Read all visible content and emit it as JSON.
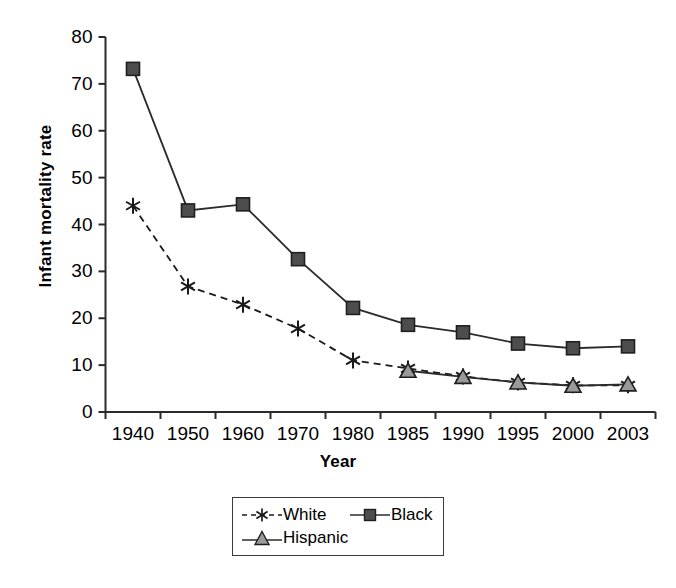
{
  "chart_data": {
    "type": "line",
    "title": "",
    "xlabel": "Year",
    "ylabel": "Infant mortality rate",
    "categories": [
      "1940",
      "1950",
      "1960",
      "1970",
      "1980",
      "1985",
      "1990",
      "1995",
      "2000",
      "2003"
    ],
    "ylim": [
      0,
      80
    ],
    "yticks": [
      0,
      10,
      20,
      30,
      40,
      50,
      60,
      70,
      80
    ],
    "grid": false,
    "legend_position": "bottom-center",
    "series": [
      {
        "name": "White",
        "marker": "asterisk",
        "line_style": "dashed",
        "color": "#1a1a1a",
        "values": [
          44.0,
          26.8,
          22.9,
          17.8,
          11.0,
          9.3,
          7.6,
          6.3,
          5.7,
          5.7
        ]
      },
      {
        "name": "Black",
        "marker": "square",
        "line_style": "solid",
        "color": "#4d4d4d",
        "values": [
          73.2,
          43.0,
          44.3,
          32.6,
          22.2,
          18.6,
          17.0,
          14.6,
          13.6,
          14.0
        ]
      },
      {
        "name": "Hispanic",
        "marker": "triangle",
        "line_style": "solid",
        "color": "#9a9a9a",
        "values": [
          null,
          null,
          null,
          null,
          null,
          8.8,
          7.5,
          6.3,
          5.6,
          5.9
        ]
      }
    ]
  },
  "axes": {
    "y_label": "Infant mortality rate",
    "x_label": "Year",
    "y_tick_labels": [
      "80",
      "70",
      "60",
      "50",
      "40",
      "30",
      "20",
      "10",
      "0"
    ],
    "x_tick_labels": [
      "1940",
      "1950",
      "1960",
      "1970",
      "1980",
      "1985",
      "1990",
      "1995",
      "2000",
      "2003"
    ]
  },
  "legend": {
    "items": [
      {
        "label": "White"
      },
      {
        "label": "Black"
      },
      {
        "label": "Hispanic"
      }
    ]
  },
  "colors": {
    "axis": "#2b2b2b",
    "white_series": "#1a1a1a",
    "black_series": "#4d4d4d",
    "hispanic_series": "#9a9a9a"
  }
}
